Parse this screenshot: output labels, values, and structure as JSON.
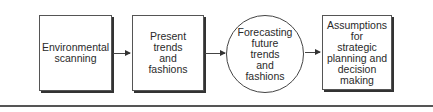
{
  "diagram": {
    "nodes": [
      {
        "id": "environmental-scanning",
        "shape": "box",
        "label": "Environmental\nscanning"
      },
      {
        "id": "present-trends",
        "shape": "box",
        "label": "Present\ntrends\nand\nfashions"
      },
      {
        "id": "forecasting",
        "shape": "circle",
        "label": "Forecasting\nfuture\ntrends\nand\nfashions"
      },
      {
        "id": "assumptions",
        "shape": "box",
        "label": "Assumptions\nfor\nstrategic\nplanning and\ndecision\nmaking"
      }
    ],
    "edges": [
      {
        "from": "environmental-scanning",
        "to": "present-trends"
      },
      {
        "from": "present-trends",
        "to": "forecasting"
      },
      {
        "from": "forecasting",
        "to": "assumptions"
      }
    ]
  }
}
